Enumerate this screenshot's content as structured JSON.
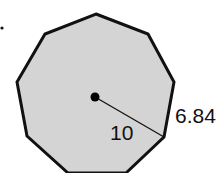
{
  "diagram": {
    "shape": "regular nonagon",
    "sides": 9,
    "fill_color": "#d4d4d4",
    "stroke_color": "#111111",
    "radius_label": "10",
    "side_label": "6.84"
  }
}
